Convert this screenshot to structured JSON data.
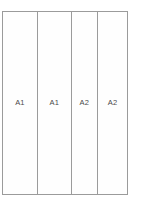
{
  "diagram": {
    "type": "panel-elevation",
    "outline": {
      "border_color": "#9b9b9b",
      "fill_color": "#fefefe",
      "background_color": "#ffffff"
    },
    "columns": [
      {
        "label": "A1",
        "width_ratio": 35,
        "name": "panel-a1-left"
      },
      {
        "label": "A1",
        "width_ratio": 34,
        "name": "panel-a1-right"
      },
      {
        "label": "A2",
        "width_ratio": 26,
        "name": "panel-a2-left"
      },
      {
        "label": "A2",
        "width_ratio": 30,
        "name": "panel-a2-right"
      }
    ],
    "label_color": "#4a4a4a"
  }
}
